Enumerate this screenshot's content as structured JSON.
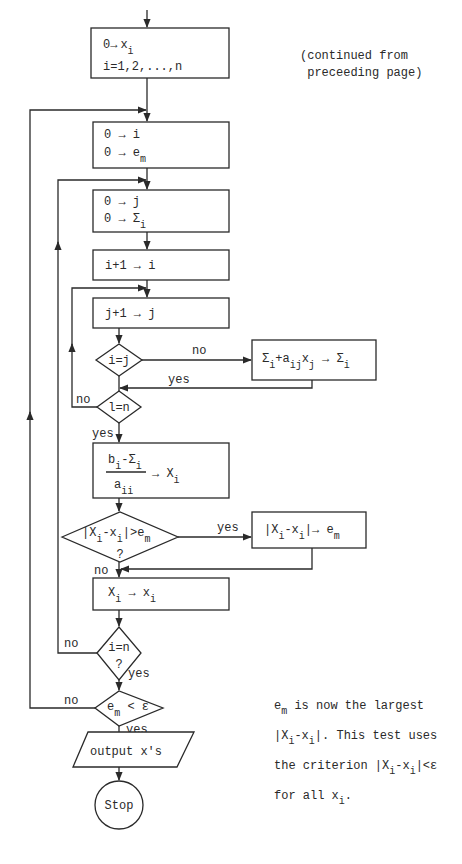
{
  "diagram": {
    "type": "flowchart",
    "continued_note": [
      "(continued from",
      "preceeding page)"
    ],
    "nodes": {
      "init_x": {
        "line1_a": "0",
        "line1_arrow": "→",
        "line1_b": "x",
        "line1_sub": "i",
        "line2": "i=1,2,...,n"
      },
      "init_i_em": {
        "line1": "0 → i",
        "line2_a": "0 → e",
        "line2_sub": "m"
      },
      "init_j_sum": {
        "line1": "0 → j",
        "line2_a": "0 → Σ",
        "line2_sub": "i"
      },
      "inc_i": {
        "label": "i+1 → i"
      },
      "inc_j": {
        "label": "j+1 → j"
      },
      "test_i_eq_j": {
        "label": "i=j"
      },
      "accumulate": {
        "p1": "Σ",
        "p1_sub": "i",
        "p2": "+a",
        "p2_sub": "ij",
        "p3": "x",
        "p3_sub": "j",
        "p4": " → Σ",
        "p4_sub": "i"
      },
      "test_l_eq_n": {
        "label": "l=n"
      },
      "compute_X": {
        "num_a": "b",
        "num_a_sub": "i",
        "num_b": "-Σ",
        "num_b_sub": "i",
        "den": "a",
        "den_sub": "ii",
        "rhs": "→ X",
        "rhs_sub": "i"
      },
      "test_diff": {
        "p1": "|X",
        "p1_sub": "i",
        "p2": "-x",
        "p2_sub": "i",
        "p3": "|>e",
        "p3_sub": "m",
        "q": "?"
      },
      "update_em": {
        "p1": "|X",
        "p1_sub": "i",
        "p2": "-x",
        "p2_sub": "i",
        "p3": "|→ e",
        "p3_sub": "m"
      },
      "assign_x": {
        "p1": "X",
        "p1_sub": "i",
        "p2": " → x",
        "p2_sub": "i"
      },
      "test_i_eq_n": {
        "label": "i=n",
        "q": "?"
      },
      "test_converged": {
        "p1": "e",
        "p1_sub": "m",
        "p2": " < ε"
      },
      "output": {
        "label": "output x's"
      },
      "stop": {
        "label": "Stop"
      }
    },
    "edge_labels": {
      "i_eq_j_no": "no",
      "i_eq_j_yes": "yes",
      "l_eq_n_no": "no",
      "l_eq_n_yes": "yes",
      "diff_yes": "yes",
      "diff_no": "no",
      "i_eq_n_no": "no",
      "i_eq_n_yes": "yes",
      "conv_no": "no",
      "conv_yes": "yes"
    },
    "side_note": {
      "l1_a": "e",
      "l1_sub": "m",
      "l1_b": " is now the largest",
      "l2_a": "|X",
      "l2_sub1": "i",
      "l2_b": "-x",
      "l2_sub2": "i",
      "l2_c": "|.  This test uses",
      "l3_a": "the criterion |X",
      "l3_sub1": "i",
      "l3_b": "-x",
      "l3_sub2": "i",
      "l3_c": "|<ε",
      "l4_a": "for all x",
      "l4_sub": "i",
      "l4_b": "."
    }
  }
}
